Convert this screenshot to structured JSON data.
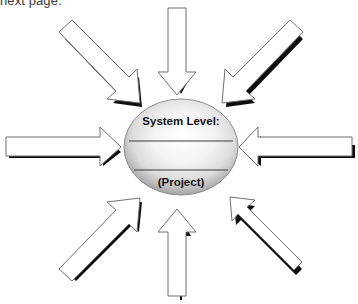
{
  "page": {
    "caption_fragment": "next page.",
    "width": 358,
    "height": 304,
    "background_color": "#ffffff"
  },
  "hub": {
    "shape": "sphere",
    "title": "System Level:",
    "subtitle": "(Project)",
    "divider_count": 2,
    "center_x": 181,
    "center_y": 147,
    "radius_x": 57,
    "radius_y": 48,
    "gradient_light": "#ffffff",
    "gradient_mid": "#e8e8e8",
    "gradient_dark": "#9a9a9a",
    "outline_color": "#8c8c8c",
    "divider_color": "#3c3c3c",
    "text_color": "#101010"
  },
  "arrows": {
    "fill_color": "#ffffff",
    "outline_color": "#6f6f6f",
    "shadow_color": "#000000",
    "direction_note": "all arrows converge inward toward hub",
    "items": [
      {
        "id": "arrow-north",
        "label": "north",
        "direction": "down",
        "angle_deg": 90,
        "points_toward": "hub"
      },
      {
        "id": "arrow-northeast",
        "label": "northeast",
        "direction": "down-left",
        "angle_deg": 135,
        "points_toward": "hub"
      },
      {
        "id": "arrow-east",
        "label": "east",
        "direction": "left",
        "angle_deg": 180,
        "points_toward": "hub"
      },
      {
        "id": "arrow-southeast",
        "label": "southeast",
        "direction": "up-left",
        "angle_deg": 225,
        "points_toward": "hub"
      },
      {
        "id": "arrow-south",
        "label": "south",
        "direction": "up",
        "angle_deg": 270,
        "points_toward": "hub"
      },
      {
        "id": "arrow-southwest",
        "label": "southwest",
        "direction": "up-right",
        "angle_deg": 315,
        "points_toward": "hub"
      },
      {
        "id": "arrow-west",
        "label": "west",
        "direction": "right",
        "angle_deg": 0,
        "points_toward": "hub"
      },
      {
        "id": "arrow-northwest",
        "label": "northwest",
        "direction": "down-right",
        "angle_deg": 45,
        "points_toward": "hub"
      }
    ]
  }
}
